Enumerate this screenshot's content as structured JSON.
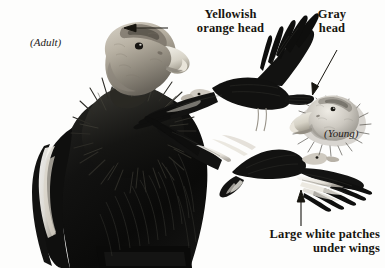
{
  "plate": {
    "title": "California Condor identification plate",
    "background_color": "#fdfdfc",
    "ink_color": "#17150f",
    "width": 385,
    "height": 268
  },
  "callouts": [
    {
      "name": "yellowish-orange-head",
      "line1": "Yellowish",
      "line2": "orange head",
      "align": "center",
      "arrow": "left"
    },
    {
      "name": "gray-head",
      "line1": "Gray",
      "line2": "head",
      "align": "center",
      "arrow": "diagonal-down-left"
    },
    {
      "name": "large-white-patches-under-wings",
      "line1": "Large white patches",
      "line2": "under wings",
      "align": "right",
      "arrow": "up"
    }
  ],
  "age_labels": [
    {
      "name": "adult",
      "text": "(Adult)"
    },
    {
      "name": "young",
      "text": "(Young)"
    }
  ],
  "subjects": [
    {
      "name": "perched-adult-condor",
      "pose": "perched",
      "head_tone": "#b9b2a6",
      "body_tone": "#0d0d0c"
    },
    {
      "name": "flying-condor-upperside",
      "pose": "flying-from-above",
      "body_tone": "#111110"
    },
    {
      "name": "flying-condor-underside",
      "pose": "flying-from-below",
      "body_tone": "#121211",
      "wing_patch_tone": "#f4f2ee"
    },
    {
      "name": "young-condor-head",
      "pose": "head-study",
      "head_tone": "#cbc7bf"
    }
  ]
}
